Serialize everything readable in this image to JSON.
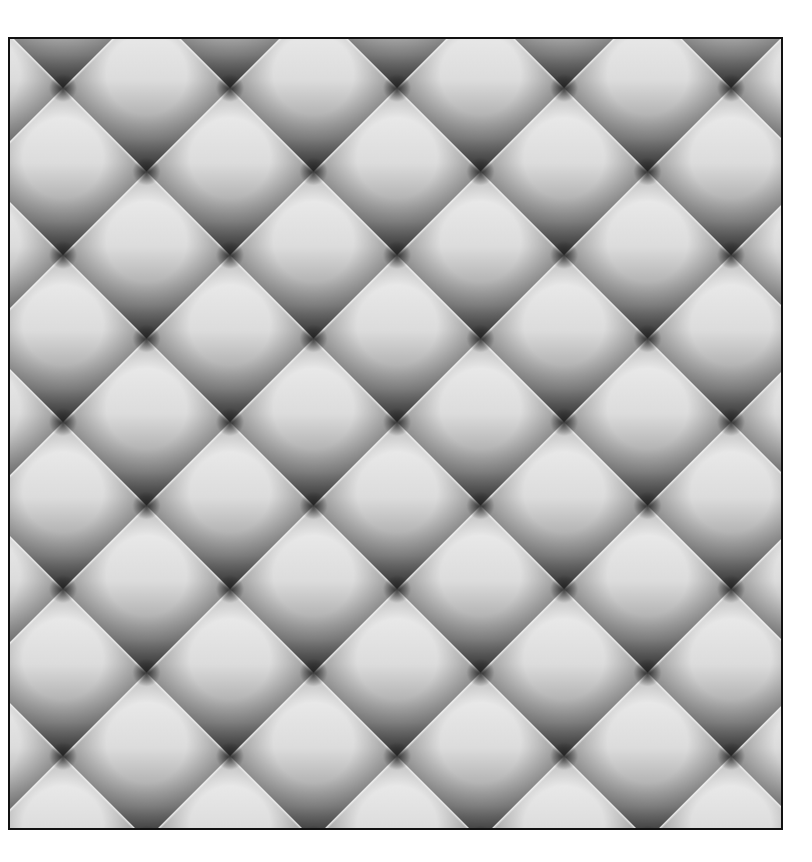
{
  "image": {
    "description": "Grayscale quilted diamond (tufted) texture in a black-bordered square",
    "pattern": "diamond-lattice",
    "node_spacing_x": 167,
    "node_spacing_y": 167,
    "colors": {
      "highlight": "#ececec",
      "mid": "#a8a8a8",
      "shadow": "#4a4a4a",
      "node": "#2e2e2e",
      "border": "#111111",
      "background": "#ffffff"
    }
  }
}
